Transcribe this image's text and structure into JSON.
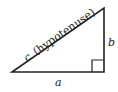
{
  "diagram": {
    "labels": {
      "hypotenuse_letter": "c",
      "hypotenuse_text": "(hypotenuse)",
      "side_a": "a",
      "side_b": "b"
    },
    "colors": {
      "stroke": "#222222",
      "background": "#ffffff"
    },
    "vertices": {
      "left": [
        12,
        72
      ],
      "right_angle": [
        104,
        72
      ],
      "top": [
        104,
        8
      ]
    },
    "right_angle_marker_size": 12
  }
}
